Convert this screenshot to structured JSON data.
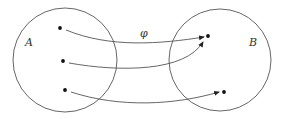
{
  "diagram": {
    "type": "function-mapping",
    "colors": {
      "stroke": "#555555",
      "dot": "#111111",
      "text": "#333333"
    },
    "sets": [
      {
        "id": "A",
        "label": "A",
        "cx": 65,
        "cy": 60,
        "r": 52,
        "label_x": 25,
        "label_y": 46
      },
      {
        "id": "B",
        "label": "B",
        "cx": 220,
        "cy": 60,
        "r": 51,
        "label_x": 249,
        "label_y": 46
      }
    ],
    "mapping_label": {
      "text": "φ",
      "x": 140,
      "y": 37
    },
    "domain_points": [
      {
        "x": 60,
        "y": 28
      },
      {
        "x": 63,
        "y": 61
      },
      {
        "x": 65,
        "y": 90
      }
    ],
    "codomain_points": [
      {
        "x": 208,
        "y": 36
      },
      {
        "x": 224,
        "y": 92
      }
    ],
    "arrows": [
      {
        "from": 0,
        "to": 0,
        "path": "M66 30 C 110 48, 160 44, 204 37"
      },
      {
        "from": 1,
        "to": 0,
        "path": "M69 63 C 120 72, 185 72, 203 42"
      },
      {
        "from": 2,
        "to": 1,
        "path": "M71 92 C 120 108, 175 105, 219 92"
      }
    ]
  }
}
